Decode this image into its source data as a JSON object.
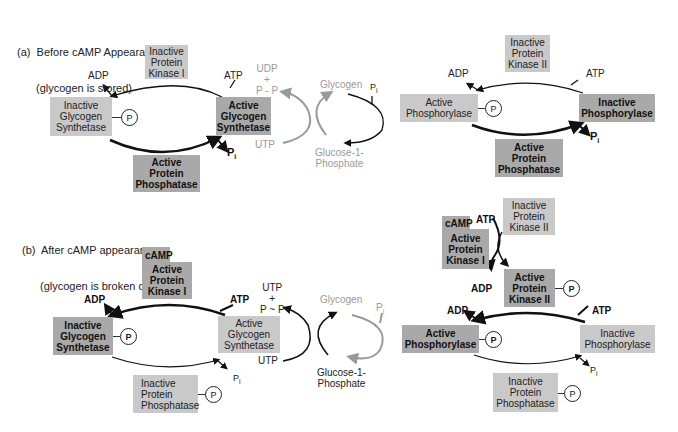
{
  "panel_a": {
    "title_line1": "(a)  Before cAMP Appearance",
    "title_line2": "(glycogen is stored)",
    "synthetase_cycle": {
      "kinase": "Inactive\nProtein\nKinase I",
      "inactive_enzyme": "Inactive\nGlycogen\nSynthetase",
      "active_enzyme": "Active\nGlycogen\nSynthetase",
      "phosphatase": "Active\nProtein\nPhosphatase",
      "adp": "ADP",
      "atp": "ATP",
      "pi": "P",
      "pi_sub": "i",
      "phosphate": "P"
    },
    "glycogen_pathway": {
      "udp": "UDP\n+\nP - P",
      "utp": "UTP",
      "glycogen": "Glycogen",
      "pi": "P",
      "pi_sub": "i",
      "g1p": "Glucose-1-\nPhosphate"
    },
    "phosphorylase_cycle": {
      "kinase": "Inactive\nProtein\nKinase II",
      "active_enzyme": "Active\nPhosphorylase",
      "inactive_enzyme": "Inactive\nPhosphorylase",
      "phosphatase": "Active\nProtein\nPhosphatase",
      "adp": "ADP",
      "atp": "ATP",
      "pi": "P",
      "pi_sub": "i",
      "phosphate": "P"
    }
  },
  "panel_b": {
    "title_line1": "(b)  After cAMP appearance",
    "title_line2": "(glycogen is broken down)",
    "synthetase_cycle": {
      "camp": "cAMP",
      "kinase": "Active\nProtein\nKinase I",
      "inactive_enzyme": "Inactive\nGlycogen\nSynthetase",
      "active_enzyme": "Active\nGlycogen\nSynthetase",
      "phosphatase": "Inactive\nProtein\nPhosphatase",
      "adp": "ADP",
      "atp": "ATP",
      "pi": "P",
      "pi_sub": "i",
      "phosphate": "P",
      "phosphatase_phosphate": "P"
    },
    "glycogen_pathway": {
      "utp_pp": "UTP\n+\nP ~ P",
      "utp": "UTP",
      "glycogen": "Glycogen",
      "pi": "P",
      "pi_sub": "i",
      "g1p": "Glucose-1-\nPhosphate"
    },
    "phosphorylase_cycle": {
      "camp": "cAMP",
      "kinase1": "Active\nProtein\nKinase I",
      "kinase2_inactive": "Inactive\nProtein\nKinase II",
      "kinase2_active": "Active\nProtein\nKinase II",
      "atp_top": "ATP",
      "adp_mid": "ADP",
      "active_enzyme": "Active\nPhosphorylase",
      "inactive_enzyme": "Inactive\nPhosphorylase",
      "phosphatase": "Inactive\nProtein\nPhosphatase",
      "adp": "ADP",
      "atp": "ATP",
      "pi": "P",
      "pi_sub": "i",
      "phosphate": "P",
      "kinase2_phosphate": "P",
      "phosphatase_phosphate": "P"
    }
  }
}
